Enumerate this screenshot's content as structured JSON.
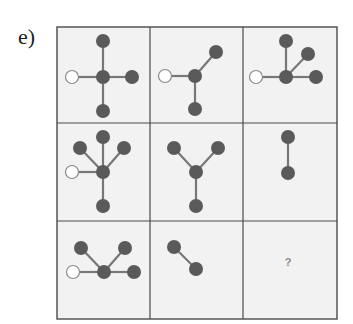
{
  "puzzle": {
    "label": "e)",
    "missing_symbol": "?",
    "colors": {
      "cell_background": "#f2f2f2",
      "grid_line": "#4a4a4a",
      "filled_node": "#5a5a5a",
      "edge": "#777777",
      "open_node_stroke": "#8a8a8a",
      "open_node_fill": "#ffffff",
      "question_mark": "#8a8a8a"
    },
    "grid": {
      "left": 57,
      "top": 27,
      "right": 337,
      "bottom": 319,
      "col_lines": [
        150,
        243
      ],
      "row_lines": [
        123,
        221
      ]
    },
    "cells": [
      {
        "row": 0,
        "col": 0,
        "description": "cross: open node left, filled up/right/down",
        "center": [
          103,
          77
        ],
        "nodes": [
          {
            "x": 72,
            "y": 77,
            "type": "open"
          },
          {
            "x": 103,
            "y": 41,
            "type": "filled"
          },
          {
            "x": 132,
            "y": 77,
            "type": "filled"
          },
          {
            "x": 103,
            "y": 111,
            "type": "filled"
          }
        ]
      },
      {
        "row": 0,
        "col": 1,
        "description": "open node left, filled upper-right and down",
        "center": [
          195,
          76
        ],
        "nodes": [
          {
            "x": 165,
            "y": 76,
            "type": "open"
          },
          {
            "x": 216,
            "y": 52,
            "type": "filled"
          },
          {
            "x": 195,
            "y": 109,
            "type": "filled"
          }
        ]
      },
      {
        "row": 0,
        "col": 2,
        "description": "open node left, filled up, upper-right, right",
        "center": [
          286,
          77
        ],
        "nodes": [
          {
            "x": 256,
            "y": 77,
            "type": "open"
          },
          {
            "x": 286,
            "y": 41,
            "type": "filled"
          },
          {
            "x": 308,
            "y": 54,
            "type": "filled"
          },
          {
            "x": 316,
            "y": 77,
            "type": "filled"
          }
        ]
      },
      {
        "row": 1,
        "col": 0,
        "description": "open node left, filled up, upper-left, upper-right, down",
        "center": [
          103,
          172
        ],
        "nodes": [
          {
            "x": 72,
            "y": 172,
            "type": "open"
          },
          {
            "x": 103,
            "y": 137,
            "type": "filled"
          },
          {
            "x": 80,
            "y": 148,
            "type": "filled"
          },
          {
            "x": 124,
            "y": 148,
            "type": "filled"
          },
          {
            "x": 103,
            "y": 206,
            "type": "filled"
          }
        ]
      },
      {
        "row": 1,
        "col": 1,
        "description": "Y shape: filled upper-left, upper-right, down",
        "center": [
          196,
          172
        ],
        "nodes": [
          {
            "x": 174,
            "y": 148,
            "type": "filled"
          },
          {
            "x": 218,
            "y": 148,
            "type": "filled"
          },
          {
            "x": 196,
            "y": 206,
            "type": "filled"
          }
        ]
      },
      {
        "row": 1,
        "col": 2,
        "description": "vertical pair",
        "center": null,
        "nodes": [
          {
            "x": 288,
            "y": 137,
            "type": "filled"
          },
          {
            "x": 288,
            "y": 173,
            "type": "filled"
          }
        ],
        "edges": [
          [
            0,
            1
          ]
        ]
      },
      {
        "row": 2,
        "col": 0,
        "description": "open node left, filled upper-left, upper-right, right",
        "center": [
          104,
          272
        ],
        "nodes": [
          {
            "x": 73,
            "y": 272,
            "type": "open"
          },
          {
            "x": 81,
            "y": 248,
            "type": "filled"
          },
          {
            "x": 125,
            "y": 248,
            "type": "filled"
          },
          {
            "x": 134,
            "y": 272,
            "type": "filled"
          }
        ]
      },
      {
        "row": 2,
        "col": 1,
        "description": "diagonal pair",
        "center": null,
        "nodes": [
          {
            "x": 174,
            "y": 247,
            "type": "filled"
          },
          {
            "x": 196,
            "y": 269,
            "type": "filled"
          }
        ],
        "edges": [
          [
            0,
            1
          ]
        ]
      },
      {
        "row": 2,
        "col": 2,
        "description": "missing — question mark",
        "question": {
          "x": 288,
          "y": 266
        }
      }
    ]
  }
}
